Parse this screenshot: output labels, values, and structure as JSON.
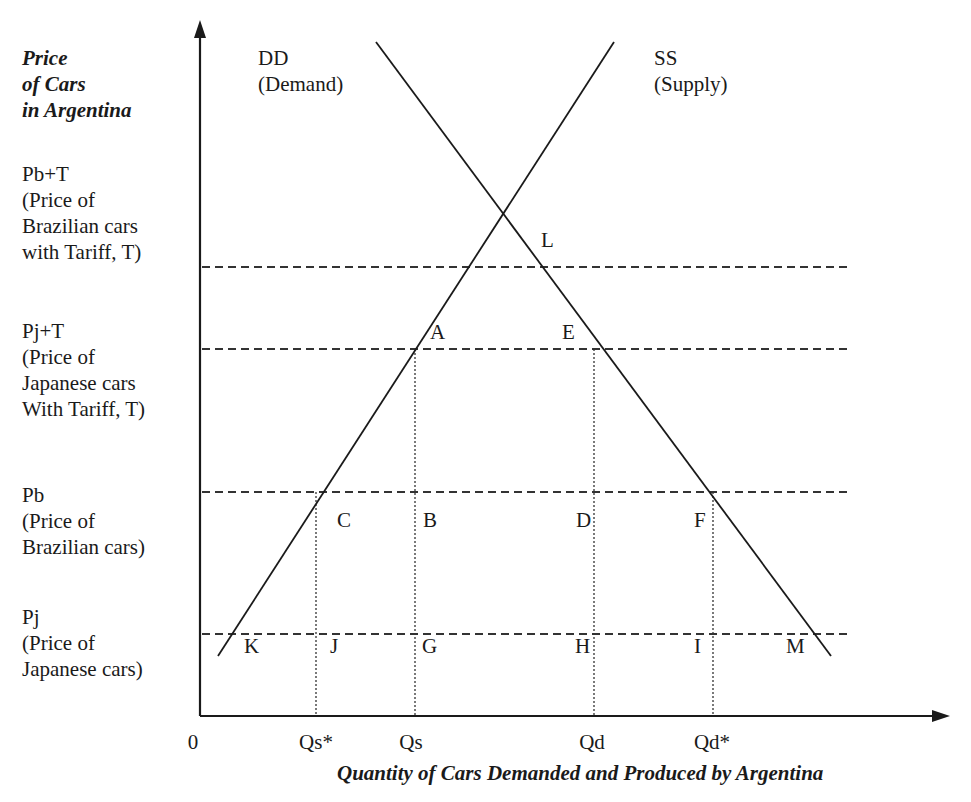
{
  "diagram": {
    "type": "supply-demand",
    "y_axis_title": [
      "Price",
      "of Cars",
      "in Argentina"
    ],
    "x_axis_title": "Quantity of Cars Demanded and Produced by Argentina",
    "origin_label": "0",
    "curves": {
      "demand": {
        "name": "DD",
        "desc": "(Demand)"
      },
      "supply": {
        "name": "SS",
        "desc": "(Supply)"
      }
    },
    "price_levels": [
      {
        "id": "pbt",
        "lines": [
          "Pb+T",
          "(Price of",
          "Brazilian cars",
          "with Tariff, T)"
        ]
      },
      {
        "id": "pjt",
        "lines": [
          "Pj+T",
          "(Price of",
          "Japanese cars",
          "With Tariff, T)"
        ]
      },
      {
        "id": "pb",
        "lines": [
          "Pb",
          "(Price of",
          "Brazilian cars)"
        ]
      },
      {
        "id": "pj",
        "lines": [
          "Pj",
          "(Price of",
          "Japanese cars)"
        ]
      }
    ],
    "quantity_ticks": [
      "Qs*",
      "Qs",
      "Qd",
      "Qd*"
    ],
    "points": {
      "A": "A",
      "B": "B",
      "C": "C",
      "D": "D",
      "E": "E",
      "F": "F",
      "G": "G",
      "H": "H",
      "I": "I",
      "J": "J",
      "K": "K",
      "L": "L",
      "M": "M"
    },
    "colors": {
      "line": "#1a1a1a",
      "dashed": "#333333",
      "background": "#ffffff"
    }
  }
}
